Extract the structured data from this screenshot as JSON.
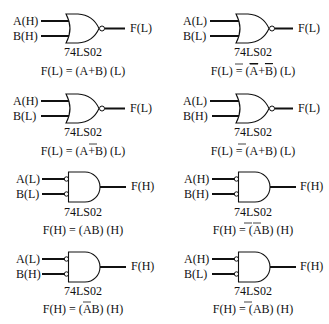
{
  "gates": [
    {
      "id": "g1",
      "type": "nor",
      "input_bubbles": false,
      "output_bubble": true,
      "input_a": "A(H)",
      "input_b": "B(H)",
      "output": "F(L)",
      "chip": "74LS02",
      "equation": {
        "lhs": "F(L) = (",
        "terms": [
          {
            "t": "A",
            "bar": false
          },
          {
            "t": "+",
            "bar": false
          },
          {
            "t": "B",
            "bar": false
          }
        ],
        "rhs": ") (L)"
      }
    },
    {
      "id": "g2",
      "type": "nor",
      "input_bubbles": false,
      "output_bubble": true,
      "input_a": "A(L)",
      "input_b": "B(L)",
      "output": "F(L)",
      "chip": "74LS02",
      "equation": {
        "lhs": "F(L) = (",
        "terms": [
          {
            "t": "A",
            "bar": true
          },
          {
            "t": "+",
            "bar": false
          },
          {
            "t": "B",
            "bar": true
          }
        ],
        "rhs": ") (L)"
      }
    },
    {
      "id": "g3",
      "type": "nor",
      "input_bubbles": false,
      "output_bubble": true,
      "input_a": "A(H)",
      "input_b": "B(L)",
      "output": "F(L)",
      "chip": "74LS02",
      "equation": {
        "lhs": "F(L) = (",
        "terms": [
          {
            "t": "A",
            "bar": false
          },
          {
            "t": "+",
            "bar": false
          },
          {
            "t": "B",
            "bar": true
          }
        ],
        "rhs": ") (L)"
      }
    },
    {
      "id": "g4",
      "type": "nor",
      "input_bubbles": false,
      "output_bubble": true,
      "input_a": "A(L)",
      "input_b": "B(H)",
      "output": "F(L)",
      "chip": "74LS02",
      "equation": {
        "lhs": "F(L) = (",
        "terms": [
          {
            "t": "A",
            "bar": true
          },
          {
            "t": "+",
            "bar": false
          },
          {
            "t": "B",
            "bar": false
          }
        ],
        "rhs": ") (L)"
      }
    },
    {
      "id": "g5",
      "type": "and",
      "input_bubbles": true,
      "output_bubble": false,
      "input_a": "A(L)",
      "input_b": "B(L)",
      "output": "F(H)",
      "chip": "74LS02",
      "equation": {
        "lhs": "F(H) = (",
        "terms": [
          {
            "t": "A",
            "bar": false
          },
          {
            "t": "B",
            "bar": false
          }
        ],
        "rhs": ") (H)"
      }
    },
    {
      "id": "g6",
      "type": "and",
      "input_bubbles": true,
      "output_bubble": false,
      "input_a": "A(H)",
      "input_b": "B(H)",
      "output": "F(H)",
      "chip": "74LS02",
      "equation": {
        "lhs": "F(H) = (",
        "terms": [
          {
            "t": "A",
            "bar": true
          },
          {
            "t": "B",
            "bar": true
          }
        ],
        "rhs": ") (H)"
      }
    },
    {
      "id": "g7",
      "type": "and",
      "input_bubbles": true,
      "output_bubble": false,
      "input_a": "A(L)",
      "input_b": "B(H)",
      "output": "F(H)",
      "chip": "74LS02",
      "equation": {
        "lhs": "F(H) = (",
        "terms": [
          {
            "t": "A",
            "bar": false
          },
          {
            "t": "B",
            "bar": true
          }
        ],
        "rhs": ") (H)"
      }
    },
    {
      "id": "g8",
      "type": "and",
      "input_bubbles": true,
      "output_bubble": false,
      "input_a": "A(H)",
      "input_b": "B(L)",
      "output": "F(H)",
      "chip": "74LS02",
      "equation": {
        "lhs": "F(H) = (",
        "terms": [
          {
            "t": "A",
            "bar": true
          },
          {
            "t": "B",
            "bar": false
          }
        ],
        "rhs": ") (H)"
      }
    }
  ]
}
